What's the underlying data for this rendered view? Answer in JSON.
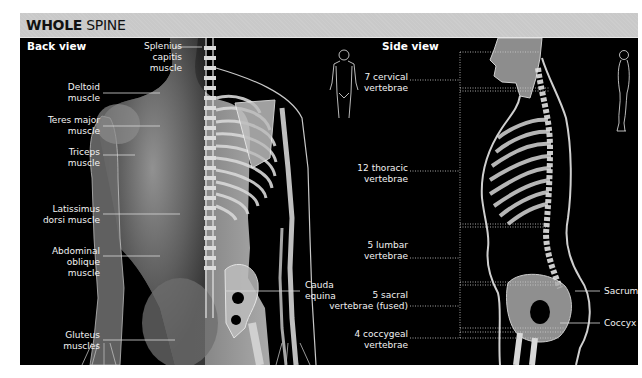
{
  "title": {
    "bold": "WHOLE",
    "rest": " SPINE"
  },
  "back_view": {
    "heading": "Back view",
    "labels": [
      {
        "id": "splenius",
        "lines": [
          "Splenius",
          "capitis",
          "muscle"
        ]
      },
      {
        "id": "deltoid",
        "lines": [
          "Deltoid",
          "muscle"
        ]
      },
      {
        "id": "teres",
        "lines": [
          "Teres major",
          "muscle"
        ]
      },
      {
        "id": "triceps",
        "lines": [
          "Triceps",
          "muscle"
        ]
      },
      {
        "id": "latissimus",
        "lines": [
          "Latissimus",
          "dorsi muscle"
        ]
      },
      {
        "id": "abdominal",
        "lines": [
          "Abdominal",
          "oblique",
          "muscle"
        ]
      },
      {
        "id": "gluteus",
        "lines": [
          "Gluteus",
          "muscles"
        ]
      },
      {
        "id": "cauda",
        "lines": [
          "Cauda",
          "equina"
        ]
      }
    ]
  },
  "side_view": {
    "heading": "Side view",
    "labels": [
      {
        "id": "cervical",
        "lines": [
          "7 cervical",
          "vertebrae"
        ]
      },
      {
        "id": "thoracic",
        "lines": [
          "12 thoracic",
          "vertebrae"
        ]
      },
      {
        "id": "lumbar",
        "lines": [
          "5 lumbar",
          "vertebrae"
        ]
      },
      {
        "id": "sacral",
        "lines": [
          "5 sacral",
          "vertebrae (fused)"
        ]
      },
      {
        "id": "coccygeal",
        "lines": [
          "4 coccygeal",
          "vertebrae"
        ]
      },
      {
        "id": "sacrum",
        "lines": [
          "Sacrum"
        ]
      },
      {
        "id": "coccyx",
        "lines": [
          "Coccyx"
        ]
      }
    ]
  },
  "icons": [
    "human-front-silhouette-icon",
    "human-side-silhouette-icon"
  ]
}
